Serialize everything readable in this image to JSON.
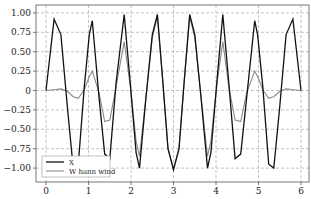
{
  "chart_data": {
    "type": "line",
    "title": "",
    "xlabel": "",
    "ylabel": "",
    "xlim": [
      -0.22,
      6.2
    ],
    "ylim": [
      -1.1,
      1.1
    ],
    "grid": true,
    "legend_position": "lower left",
    "x_ticks": [
      0,
      1,
      2,
      3,
      4,
      5,
      6
    ],
    "x_tick_labels": [
      "0",
      "1",
      "2",
      "3",
      "4",
      "5",
      "6"
    ],
    "y_ticks": [
      1.0,
      0.75,
      0.5,
      0.25,
      0,
      -0.25,
      -0.5,
      -0.75,
      -1.0
    ],
    "y_tick_labels": [
      "1.00",
      "0.75",
      "0.50",
      "0.25",
      "0",
      "−0.25",
      "−0.50",
      "−0.75",
      "−1.00"
    ],
    "series": [
      {
        "name": "X",
        "color": "#111111",
        "width": 1.3,
        "points": [
          [
            0.0,
            0.0
          ],
          [
            0.19,
            0.92
          ],
          [
            0.35,
            0.72
          ],
          [
            0.5,
            -0.2
          ],
          [
            0.64,
            -1.0
          ],
          [
            0.76,
            -0.95
          ],
          [
            0.9,
            0.05
          ],
          [
            1.02,
            0.72
          ],
          [
            1.09,
            0.9
          ],
          [
            1.25,
            -0.1
          ],
          [
            1.38,
            -0.82
          ],
          [
            1.5,
            -0.88
          ],
          [
            1.65,
            0.1
          ],
          [
            1.84,
            0.98
          ],
          [
            1.98,
            0.1
          ],
          [
            2.12,
            -0.8
          ],
          [
            2.2,
            -1.0
          ],
          [
            2.35,
            -0.1
          ],
          [
            2.5,
            0.72
          ],
          [
            2.62,
            0.98
          ],
          [
            2.75,
            0.1
          ],
          [
            2.87,
            -0.75
          ],
          [
            3.0,
            -1.02
          ],
          [
            3.13,
            -0.75
          ],
          [
            3.25,
            0.1
          ],
          [
            3.38,
            0.98
          ],
          [
            3.5,
            0.72
          ],
          [
            3.65,
            -0.1
          ],
          [
            3.8,
            -1.0
          ],
          [
            3.88,
            -0.8
          ],
          [
            4.02,
            0.1
          ],
          [
            4.16,
            0.98
          ],
          [
            4.3,
            0.1
          ],
          [
            4.45,
            -0.88
          ],
          [
            4.58,
            -0.82
          ],
          [
            4.72,
            -0.1
          ],
          [
            4.91,
            0.9
          ],
          [
            4.98,
            0.72
          ],
          [
            5.1,
            0.05
          ],
          [
            5.24,
            -0.95
          ],
          [
            5.36,
            -1.0
          ],
          [
            5.5,
            -0.2
          ],
          [
            5.65,
            0.72
          ],
          [
            5.81,
            0.92
          ],
          [
            6.0,
            0.0
          ]
        ]
      },
      {
        "name": "W hann wind",
        "color": "#8a8a8a",
        "width": 1.1,
        "points": [
          [
            0.0,
            0.0
          ],
          [
            0.19,
            0.01
          ],
          [
            0.35,
            0.02
          ],
          [
            0.5,
            -0.01
          ],
          [
            0.64,
            -0.08
          ],
          [
            0.76,
            -0.1
          ],
          [
            0.9,
            0.01
          ],
          [
            1.02,
            0.18
          ],
          [
            1.09,
            0.25
          ],
          [
            1.25,
            -0.03
          ],
          [
            1.38,
            -0.4
          ],
          [
            1.5,
            -0.38
          ],
          [
            1.65,
            0.05
          ],
          [
            1.84,
            0.63
          ],
          [
            1.98,
            0.07
          ],
          [
            2.12,
            -0.65
          ],
          [
            2.2,
            -0.85
          ],
          [
            2.35,
            -0.09
          ],
          [
            2.5,
            0.68
          ],
          [
            2.62,
            0.95
          ],
          [
            2.75,
            0.1
          ],
          [
            2.87,
            -0.75
          ],
          [
            3.0,
            -1.02
          ],
          [
            3.13,
            -0.75
          ],
          [
            3.25,
            0.1
          ],
          [
            3.38,
            0.95
          ],
          [
            3.5,
            0.68
          ],
          [
            3.65,
            -0.09
          ],
          [
            3.8,
            -0.85
          ],
          [
            3.88,
            -0.65
          ],
          [
            4.02,
            0.07
          ],
          [
            4.16,
            0.63
          ],
          [
            4.3,
            0.05
          ],
          [
            4.45,
            -0.38
          ],
          [
            4.58,
            -0.4
          ],
          [
            4.72,
            -0.03
          ],
          [
            4.91,
            0.25
          ],
          [
            4.98,
            0.18
          ],
          [
            5.1,
            0.01
          ],
          [
            5.24,
            -0.1
          ],
          [
            5.36,
            -0.08
          ],
          [
            5.5,
            -0.01
          ],
          [
            5.65,
            0.02
          ],
          [
            5.81,
            0.01
          ],
          [
            6.0,
            0.0
          ]
        ]
      }
    ]
  },
  "legend": {
    "items": [
      {
        "label": "X",
        "color": "#111111"
      },
      {
        "label": "W hann wind",
        "color": "#8a8a8a"
      }
    ]
  }
}
